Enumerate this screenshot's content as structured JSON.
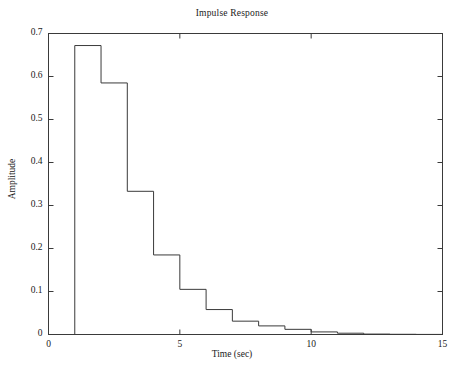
{
  "chart_data": {
    "type": "line",
    "subtype": "stairs",
    "title": "Impulse Response",
    "xlabel": "Time (sec)",
    "ylabel": "Amplitude",
    "xlim": [
      0,
      15
    ],
    "ylim": [
      0,
      0.7
    ],
    "xticks": [
      0,
      5,
      10,
      15
    ],
    "xtick_labels": [
      "0",
      "5",
      "10",
      "15"
    ],
    "yticks": [
      0,
      0.1,
      0.2,
      0.3,
      0.4,
      0.5,
      0.6,
      0.7
    ],
    "ytick_labels": [
      "0",
      "0.1",
      "0.2",
      "0.3",
      "0.4",
      "0.5",
      "0.6",
      "0.7"
    ],
    "grid": false,
    "legend": null,
    "line_color": "#3a3a3a",
    "line_width": 1,
    "x": [
      0,
      1,
      2,
      3,
      4,
      5,
      6,
      7,
      8,
      9,
      10,
      11,
      12,
      13,
      14,
      15
    ],
    "values": [
      0,
      0.672,
      0.585,
      0.333,
      0.185,
      0.105,
      0.058,
      0.031,
      0.02,
      0.012,
      0.006,
      0.003,
      0.001,
      0.0005,
      0.0002,
      0.0
    ],
    "series": [
      {
        "name": "Impulse Response",
        "x": [
          0,
          1,
          2,
          3,
          4,
          5,
          6,
          7,
          8,
          9,
          10,
          11,
          12,
          13,
          14,
          15
        ],
        "values": [
          0,
          0.672,
          0.585,
          0.333,
          0.185,
          0.105,
          0.058,
          0.031,
          0.02,
          0.012,
          0.006,
          0.003,
          0.001,
          0.0005,
          0.0002,
          0.0
        ]
      }
    ]
  }
}
